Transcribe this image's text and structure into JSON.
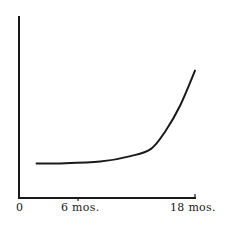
{
  "chart_data": {
    "type": "line",
    "title": "",
    "xlabel": "",
    "ylabel": "",
    "x_tick_labels": [
      "0",
      "6 mos.",
      "18 mos."
    ],
    "x_tick_positions": [
      0,
      6,
      18
    ],
    "xlim": [
      0,
      18
    ],
    "ylim": [
      0,
      100
    ],
    "grid": false,
    "legend": null,
    "series": [
      {
        "name": "curve",
        "x": [
          1.8,
          4.2,
          8.3,
          11.4,
          13.5,
          15.0,
          16.5,
          18.0
        ],
        "y": [
          19,
          19,
          20,
          23,
          27,
          37,
          51,
          70
        ]
      }
    ],
    "colors": {
      "axis": "#1a1a1a",
      "line": "#1a1a1a",
      "background": "#ffffff"
    }
  },
  "labels": {
    "origin": "0",
    "tick_6": "6 mos.",
    "tick_18": "18 mos."
  }
}
